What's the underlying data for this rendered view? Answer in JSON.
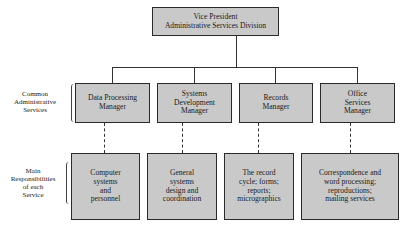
{
  "top": {
    "label": "Vice President\nAdministrative Services Division"
  },
  "row_labels": {
    "managers": "Common\nAdministrative\nServices",
    "responsibilities": "Main\nResponsibilities\nof each\nService"
  },
  "managers": [
    {
      "label": "Data Processing\nManager"
    },
    {
      "label": "Systems\nDevelopment\nManager"
    },
    {
      "label": "Records\nManager"
    },
    {
      "label": "Office\nServices\nManager"
    }
  ],
  "responsibilities": [
    {
      "label": "Computer\nsystems\nand\npersonnel"
    },
    {
      "label": "General\nsystems\ndesign and\ncoordination"
    },
    {
      "label": "The record\ncycle; forms;\nreports;\nmicrographics"
    },
    {
      "label": "Correspondence and\nword processing;\nreproductions;\nmailing services"
    }
  ],
  "colors": {
    "box_fill": "#c9c9c9",
    "line": "#333333"
  }
}
